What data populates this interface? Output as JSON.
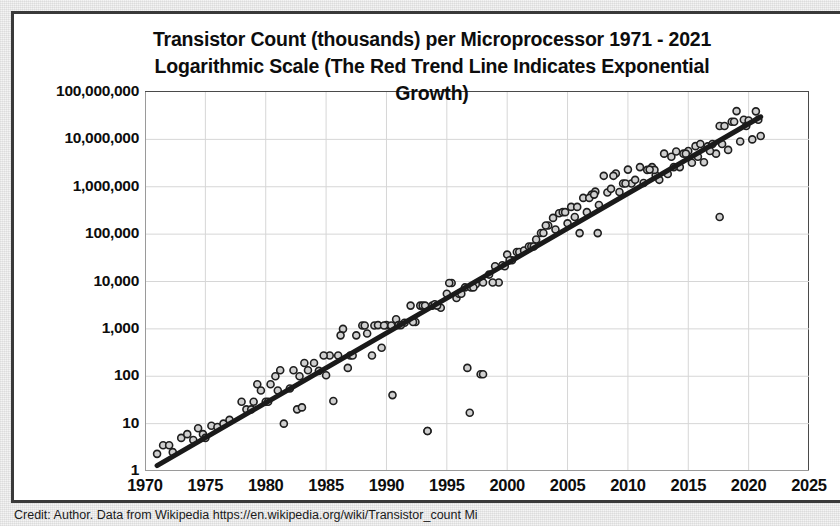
{
  "caption": "Credit: Author. Data from Wikipedia https://en.wikipedia.org/wiki/Transistor_count Mi",
  "chart_data": {
    "type": "scatter",
    "title": "Transistor Count (thousands) per Microprocessor 1971 - 2021 Logarithmic Scale (The Red Trend Line Indicates Exponential Growth)",
    "title_lines": [
      "Transistor Count (thousands) per Microprocessor 1971 - 2021",
      "Logarithmic Scale (The Red Trend Line Indicates Exponential",
      "Growth)"
    ],
    "xlabel": "",
    "ylabel": "",
    "yscale": "log",
    "xlim": [
      1970,
      2025
    ],
    "ylim": [
      1,
      100000000
    ],
    "grid": true,
    "legend": false,
    "marker": {
      "shape": "circle",
      "fill": "#d0d0d0",
      "edge": "#1f1f1f",
      "size": 7
    },
    "xticks": [
      1970,
      1975,
      1980,
      1985,
      1990,
      1995,
      2000,
      2005,
      2010,
      2015,
      2020,
      2025
    ],
    "xtick_labels": [
      "1970",
      "1975",
      "1980",
      "1985",
      "1990",
      "1995",
      "2000",
      "2005",
      "2010",
      "2015",
      "2020",
      "2025"
    ],
    "yticks": [
      1,
      10,
      100,
      1000,
      10000,
      100000,
      1000000,
      10000000,
      100000000
    ],
    "ytick_labels": [
      "1",
      "10",
      "100",
      "1,000",
      "10,000",
      "100,000",
      "1,000,000",
      "10,000,000",
      "100,000,000"
    ],
    "trendline": {
      "name": "Exponential trend",
      "color": "#c00000",
      "rendered_color": "#1a1a1a",
      "width": 5,
      "x_start": 1971,
      "x_end": 2021,
      "y_start": 1.3,
      "y_end": 30000000
    },
    "series": [
      {
        "name": "Transistor count (thousands) per microprocessor",
        "x": [
          1971,
          1971.5,
          1972,
          1972.3,
          1973,
          1973.5,
          1974,
          1974.4,
          1974.8,
          1975,
          1975.5,
          1976,
          1976.5,
          1977,
          1978,
          1978.4,
          1979,
          1979.3,
          1979.6,
          1980,
          1980.4,
          1980.8,
          1981,
          1981.5,
          1982,
          1982.3,
          1982.6,
          1983,
          1983.5,
          1984,
          1984.4,
          1985,
          1985.3,
          1985.6,
          1986,
          1986.4,
          1986.8,
          1987,
          1987.5,
          1988,
          1988.4,
          1988.8,
          1989,
          1989.3,
          1989.6,
          1990,
          1990.4,
          1990.8,
          1991,
          1991.5,
          1992,
          1992.4,
          1992.8,
          1993,
          1993.4,
          1993.8,
          1994,
          1994.5,
          1995,
          1995.4,
          1995.8,
          1996,
          1996.5,
          1997,
          1997.4,
          1997.8,
          1998,
          1998.5,
          1999,
          1999.3,
          1999.6,
          2000,
          2000.4,
          2000.8,
          2001,
          2001.4,
          2001.8,
          2002,
          2002.4,
          2002.8,
          2003,
          2003.4,
          2003.8,
          2004,
          2004.3,
          2004.6,
          2005,
          2005.3,
          2005.6,
          2006,
          2006.3,
          2006.6,
          2007,
          2007.3,
          2007.6,
          2008,
          2008.3,
          2008.6,
          2009,
          2009.3,
          2009.6,
          2010,
          2010.3,
          2010.6,
          2011,
          2011.3,
          2011.6,
          2012,
          2012.3,
          2012.6,
          2013,
          2013.3,
          2013.6,
          2014,
          2014.3,
          2014.6,
          2015,
          2015.3,
          2015.6,
          2016,
          2016.3,
          2016.6,
          2017,
          2017.3,
          2017.6,
          2018,
          2018.3,
          2018.6,
          2019,
          2019.3,
          2019.6,
          2020,
          2020.3,
          2020.6,
          2021,
          1981.2,
          1986.2,
          1991.2,
          1994.2,
          1996.2,
          1999.8,
          2004.8,
          2006.8,
          2008.8,
          2013.8,
          2017.8,
          1983.2,
          1988.2,
          1993.2,
          1997.2,
          2002.2,
          2007.2,
          2012.2,
          2015.8,
          2019.8,
          1978.8,
          1980.2,
          1982.8,
          1984.8,
          1987.2,
          1989.8,
          1992.2,
          1995.2,
          1998.8,
          2000.2,
          2003.2,
          2005.8,
          2009.8,
          2011.8,
          2014.8,
          2016.8,
          2018.8,
          2020.8
        ],
        "y": [
          2.3,
          3.5,
          3.5,
          2.5,
          5.0,
          6.0,
          4.5,
          8.0,
          6.0,
          5.0,
          9.0,
          8.5,
          10.0,
          12.0,
          29.0,
          20.0,
          29.0,
          68.0,
          50.0,
          29.0,
          68.0,
          100.0,
          50.0,
          10.0,
          55.0,
          134.0,
          20.0,
          22.0,
          134.0,
          190.0,
          130.0,
          105.0,
          275.0,
          30.0,
          275.0,
          1000.0,
          150.0,
          275.0,
          730.0,
          1180.0,
          800.0,
          275.0,
          1180.0,
          1200.0,
          400.0,
          1200.0,
          1180.0,
          1600.0,
          1200.0,
          1350.0,
          3100.0,
          1400.0,
          3100.0,
          3100.0,
          7.0,
          3100.0,
          3300.0,
          2800.0,
          5500.0,
          9300.0,
          4500.0,
          5500.0,
          7500.0,
          7500.0,
          8800.0,
          110.0,
          9500.0,
          14000.0,
          21000.0,
          9500.0,
          22000.0,
          37000.0,
          28000.0,
          42000.0,
          42000.0,
          45000.0,
          55000.0,
          55000.0,
          77000.0,
          106000.0,
          106000.0,
          152000.0,
          220000.0,
          125000.0,
          276000.0,
          291000.0,
          169000.0,
          376000.0,
          230000.0,
          105000.0,
          582000.0,
          291000.0,
          683000.0,
          789000.0,
          411000.0,
          1700000.0,
          758000.0,
          904000.0,
          1900000.0,
          774000.0,
          1170000.0,
          2300000.0,
          1170000.0,
          1400000.0,
          2600000.0,
          1200000.0,
          2270000.0,
          2600000.0,
          1750000.0,
          1400000.0,
          5000000.0,
          1860000.0,
          4310000.0,
          5560000.0,
          2600000.0,
          5000000.0,
          5700000.0,
          3200000.0,
          7200000.0,
          8000000.0,
          3300000.0,
          7100000.0,
          8000000.0,
          5000000.0,
          19200000.0,
          19200000.0,
          6000000.0,
          23600000.0,
          39500000.0,
          9000000.0,
          26000000.0,
          25000000.0,
          10000000.0,
          39000000.0,
          11800000.0,
          134.0,
          730.0,
          1200.0,
          3100.0,
          5500.0,
          21000.0,
          291000.0,
          582000.0,
          1700000.0,
          2600000.0,
          8000000.0,
          190.0,
          1180.0,
          3100.0,
          7500.0,
          55000.0,
          683000.0,
          2270000.0,
          4310000.0,
          19200000.0,
          20.0,
          29.0,
          100.0,
          275.0,
          275.0,
          1180.0,
          1400.0,
          9300.0,
          9500.0,
          28000.0,
          152000.0,
          376000.0,
          1170000.0,
          2300000.0,
          5000000.0,
          5700000.0,
          23600000.0,
          26000000.0
        ]
      }
    ],
    "outliers": [
      {
        "x": 1993.4,
        "y": 7.0
      },
      {
        "x": 1996.7,
        "y": 150.0
      },
      {
        "x": 1998.0,
        "y": 110.0
      },
      {
        "x": 1996.9,
        "y": 17.0
      },
      {
        "x": 2007.5,
        "y": 105000.0
      },
      {
        "x": 2017.6,
        "y": 230000.0
      },
      {
        "x": 1990.5,
        "y": 40.0
      }
    ]
  }
}
